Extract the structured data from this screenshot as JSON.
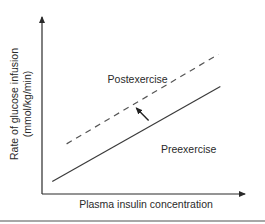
{
  "chart_data": {
    "type": "line",
    "title": "",
    "xlabel": "Plasma insulin concentration",
    "ylabel_lines": [
      "Rate of glucose infusion",
      "(mmol/kg/min)"
    ],
    "xlim": [
      0,
      1
    ],
    "ylim": [
      0,
      1
    ],
    "grid": false,
    "legend": "none (inline labels)",
    "series": [
      {
        "name": "Preexercise",
        "style": "solid",
        "color": "#3a3a3a",
        "x": [
          0.05,
          0.87
        ],
        "y": [
          0.07,
          0.6
        ]
      },
      {
        "name": "Postexercise",
        "style": "dashed",
        "color": "#555555",
        "x": [
          0.12,
          0.86
        ],
        "y": [
          0.28,
          0.78
        ]
      }
    ],
    "annotations": [
      {
        "type": "arrow",
        "meaning": "upward/leftward shift from preexercise to postexercise curve",
        "from": [
          0.52,
          0.41
        ],
        "to": [
          0.46,
          0.48
        ]
      }
    ],
    "labels": [
      {
        "text": "Postexercise",
        "x": 0.32,
        "y": 0.62
      },
      {
        "text": "Preexercise",
        "x": 0.58,
        "y": 0.23
      }
    ]
  }
}
